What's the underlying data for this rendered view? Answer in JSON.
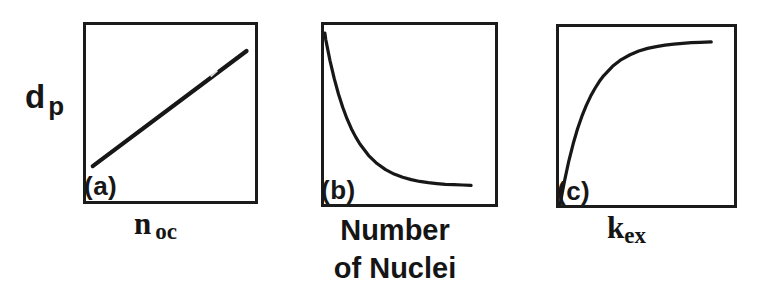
{
  "figure": {
    "background": "#ffffff",
    "ink_color": "#171717",
    "ylabel": {
      "base": "d",
      "sub": "p"
    },
    "panels": [
      {
        "tag": "(a)",
        "xlabel_base": "n",
        "xlabel_sub": "oc",
        "trend": "linear increasing"
      },
      {
        "tag": "(b)",
        "xlabel_line1": "Number",
        "xlabel_line2": "of Nuclei",
        "trend": "exponential decay"
      },
      {
        "tag": "(c)",
        "xlabel_base": "k",
        "xlabel_sub": "ex",
        "trend": "saturating growth"
      }
    ]
  },
  "chart_data": [
    {
      "type": "line",
      "panel": "(a)",
      "title": "(a)",
      "xlabel": "n_oc",
      "ylabel": "d_p",
      "trend": "linear increasing straight line from lower-left to upper-right",
      "xlim": [
        0,
        1
      ],
      "ylim": [
        0,
        1
      ],
      "ticks": "none (qualitative sketch, unlabeled axes)",
      "grid": false,
      "legend": "none",
      "x": [
        0.04,
        0.95
      ],
      "values": [
        0.198,
        0.852
      ],
      "color": "#171717",
      "stroke_width": 4.2
    },
    {
      "type": "line",
      "panel": "(b)",
      "title": "(b)",
      "xlabel": "Number of Nuclei",
      "ylabel": "",
      "trend": "exponential decay from top-left corner flattening toward lower-right",
      "xlim": [
        0,
        1
      ],
      "ylim": [
        0,
        1
      ],
      "ticks": "none (qualitative sketch, unlabeled axes)",
      "grid": false,
      "legend": "none",
      "x": [
        0.005,
        0.01,
        0.035,
        0.06,
        0.085,
        0.11,
        0.135,
        0.16,
        0.185,
        0.21,
        0.26,
        0.31,
        0.36,
        0.41,
        0.46,
        0.51,
        0.56,
        0.61,
        0.66,
        0.71,
        0.76,
        0.81,
        0.86
      ],
      "values": [
        0.955,
        0.92,
        0.801,
        0.7,
        0.613,
        0.539,
        0.475,
        0.421,
        0.375,
        0.335,
        0.272,
        0.226,
        0.192,
        0.167,
        0.149,
        0.136,
        0.126,
        0.119,
        0.114,
        0.11,
        0.108,
        0.106,
        0.104
      ],
      "color": "#171717",
      "stroke_width": 3.2
    },
    {
      "type": "line",
      "panel": "(c)",
      "title": "(c)",
      "xlabel": "k_ex",
      "ylabel": "",
      "trend": "saturating growth from bottom-left corner leveling off near top-right",
      "xlim": [
        0,
        1
      ],
      "ylim": [
        0,
        1
      ],
      "ticks": "none (qualitative sketch, unlabeled axes)",
      "grid": false,
      "legend": "none",
      "x": [
        0.006,
        0.018,
        0.031,
        0.056,
        0.081,
        0.106,
        0.131,
        0.156,
        0.181,
        0.206,
        0.231,
        0.256,
        0.306,
        0.356,
        0.406,
        0.456,
        0.506,
        0.556,
        0.606,
        0.656,
        0.706,
        0.756,
        0.806,
        0.87
      ],
      "values": [
        0.0,
        0.066,
        0.133,
        0.247,
        0.344,
        0.428,
        0.499,
        0.56,
        0.612,
        0.656,
        0.695,
        0.727,
        0.779,
        0.817,
        0.844,
        0.865,
        0.88,
        0.89,
        0.898,
        0.904,
        0.908,
        0.912,
        0.914,
        0.916
      ],
      "color": "#171717",
      "stroke_width": 3.2
    }
  ]
}
